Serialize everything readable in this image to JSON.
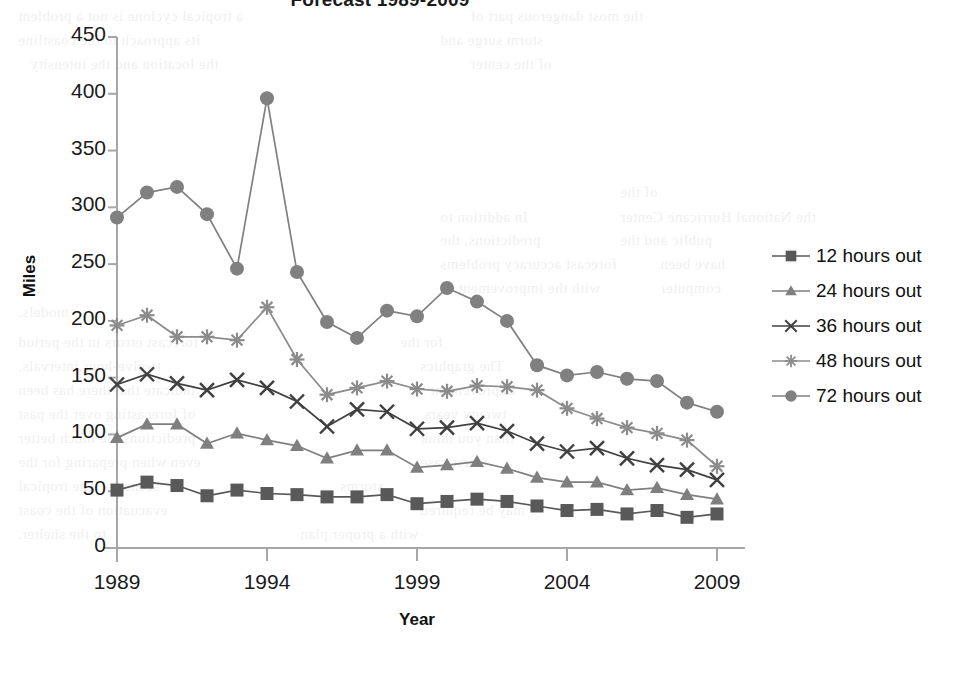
{
  "chart_data": {
    "type": "line",
    "title": "Forecast 1989-2009",
    "xlabel": "Year",
    "ylabel": "Miles",
    "x": [
      1989,
      1990,
      1991,
      1992,
      1993,
      1994,
      1995,
      1996,
      1997,
      1998,
      1999,
      2000,
      2001,
      2002,
      2003,
      2004,
      2005,
      2006,
      2007,
      2008,
      2009
    ],
    "xticks": [
      "1989",
      "1994",
      "1999",
      "2004",
      "2009"
    ],
    "xtick_values": [
      1989,
      1994,
      1999,
      2004,
      2009
    ],
    "yticks": [
      "0",
      "50",
      "100",
      "150",
      "200",
      "250",
      "300",
      "350",
      "400",
      "450"
    ],
    "ytick_values": [
      0,
      50,
      100,
      150,
      200,
      250,
      300,
      350,
      400,
      450
    ],
    "ylim": [
      0,
      450
    ],
    "xlim": [
      1989,
      2009
    ],
    "grid": false,
    "legend_position": "right",
    "series": [
      {
        "name": "12 hours out",
        "marker": "square",
        "color": "#595959",
        "values": [
          51,
          58,
          55,
          46,
          51,
          48,
          47,
          45,
          45,
          47,
          39,
          41,
          43,
          41,
          37,
          33,
          34,
          30,
          33,
          27,
          30
        ]
      },
      {
        "name": "24 hours out",
        "marker": "triangle",
        "color": "#7f7f7f",
        "values": [
          97,
          109,
          109,
          92,
          101,
          95,
          90,
          79,
          86,
          86,
          71,
          73,
          76,
          70,
          62,
          58,
          58,
          51,
          53,
          47,
          43
        ]
      },
      {
        "name": "36 hours out",
        "marker": "x",
        "color": "#404040",
        "values": [
          144,
          153,
          145,
          139,
          148,
          141,
          129,
          107,
          122,
          120,
          105,
          106,
          110,
          103,
          92,
          85,
          88,
          79,
          73,
          69,
          60
        ]
      },
      {
        "name": "48 hours out",
        "marker": "star",
        "color": "#8c8c8c",
        "values": [
          196,
          205,
          186,
          186,
          183,
          212,
          166,
          135,
          141,
          147,
          140,
          138,
          143,
          142,
          139,
          123,
          114,
          106,
          101,
          95,
          72
        ]
      },
      {
        "name": "72 hours out",
        "marker": "circle",
        "color": "#808080",
        "values": [
          291,
          313,
          318,
          294,
          246,
          396,
          243,
          199,
          185,
          209,
          204,
          229,
          217,
          200,
          161,
          152,
          155,
          149,
          147,
          128,
          120
        ]
      }
    ]
  },
  "bleed_text": [
    {
      "left": 18,
      "top": 4,
      "text": "a tropical cyclone is not a problem"
    },
    {
      "left": 470,
      "top": 4,
      "text": "the most dangerous part of"
    },
    {
      "left": 18,
      "top": 28,
      "text": "its approach to the coastline"
    },
    {
      "left": 440,
      "top": 28,
      "text": "storm surge and"
    },
    {
      "left": 30,
      "top": 52,
      "text": "the location and the intensity"
    },
    {
      "left": 470,
      "top": 52,
      "text": "of the center"
    },
    {
      "left": 620,
      "top": 180,
      "text": "of the"
    },
    {
      "left": 440,
      "top": 205,
      "text": "In addition to"
    },
    {
      "left": 620,
      "top": 205,
      "text": "the National Hurricane Center"
    },
    {
      "left": 440,
      "top": 228,
      "text": "predictions, the"
    },
    {
      "left": 620,
      "top": 228,
      "text": "public and the"
    },
    {
      "left": 440,
      "top": 252,
      "text": "forecast accuracy problems"
    },
    {
      "left": 660,
      "top": 252,
      "text": "have been"
    },
    {
      "left": 440,
      "top": 276,
      "text": "with the improvement of"
    },
    {
      "left": 660,
      "top": 276,
      "text": "computer"
    },
    {
      "left": 18,
      "top": 300,
      "text": "models."
    },
    {
      "left": 18,
      "top": 330,
      "text": "forecast errors in the period"
    },
    {
      "left": 400,
      "top": 330,
      "text": "for the"
    },
    {
      "left": 18,
      "top": 354,
      "text": "twelve-hour intervals."
    },
    {
      "left": 420,
      "top": 354,
      "text": "The graphics"
    },
    {
      "left": 18,
      "top": 378,
      "text": "indicate that there has been"
    },
    {
      "left": 430,
      "top": 378,
      "text": "improvement"
    },
    {
      "left": 18,
      "top": 402,
      "text": "of forecasting over the past"
    },
    {
      "left": 420,
      "top": 402,
      "text": "twenty years."
    },
    {
      "left": 18,
      "top": 426,
      "text": "predictions are much better"
    },
    {
      "left": 420,
      "top": 426,
      "text": "than you think"
    },
    {
      "left": 18,
      "top": 450,
      "text": "even when preparing for the"
    },
    {
      "left": 420,
      "top": 450,
      "text": "worst case"
    },
    {
      "left": 18,
      "top": 474,
      "text": "scenario. The tropical"
    },
    {
      "left": 340,
      "top": 474,
      "text": "storms"
    },
    {
      "left": 18,
      "top": 498,
      "text": "evacuation of the coast"
    },
    {
      "left": 420,
      "top": 498,
      "text": "may be required"
    },
    {
      "left": 18,
      "top": 522,
      "text": "to the shelter."
    },
    {
      "left": 300,
      "top": 522,
      "text": "with a proper plan"
    }
  ]
}
